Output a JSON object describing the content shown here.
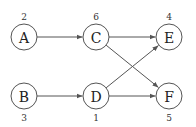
{
  "diagram": {
    "type": "directed-graph",
    "nodes": [
      {
        "id": "A",
        "label": "A",
        "weight": "2",
        "weight_pos": "above"
      },
      {
        "id": "C",
        "label": "C",
        "weight": "6",
        "weight_pos": "above"
      },
      {
        "id": "E",
        "label": "E",
        "weight": "4",
        "weight_pos": "above"
      },
      {
        "id": "B",
        "label": "B",
        "weight": "3",
        "weight_pos": "below"
      },
      {
        "id": "D",
        "label": "D",
        "weight": "1",
        "weight_pos": "below"
      },
      {
        "id": "F",
        "label": "F",
        "weight": "5",
        "weight_pos": "below"
      }
    ],
    "edges": [
      {
        "from": "A",
        "to": "C"
      },
      {
        "from": "B",
        "to": "D"
      },
      {
        "from": "C",
        "to": "E"
      },
      {
        "from": "C",
        "to": "F"
      },
      {
        "from": "D",
        "to": "E"
      },
      {
        "from": "D",
        "to": "F"
      }
    ],
    "colors": {
      "stroke": "#555555",
      "text": "#222222",
      "background": "#ffffff"
    }
  }
}
